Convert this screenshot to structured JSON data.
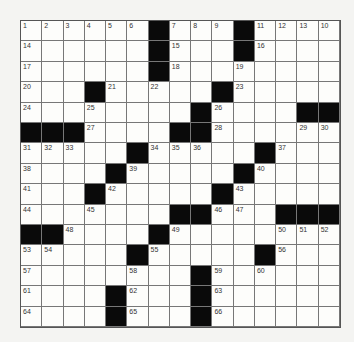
{
  "puzzle": {
    "rows": 15,
    "cols": 15,
    "blacks": [
      [
        0,
        6
      ],
      [
        0,
        10
      ],
      [
        1,
        6
      ],
      [
        1,
        10
      ],
      [
        2,
        6
      ],
      [
        3,
        3
      ],
      [
        3,
        9
      ],
      [
        4,
        8
      ],
      [
        4,
        13
      ],
      [
        4,
        14
      ],
      [
        5,
        0
      ],
      [
        5,
        1
      ],
      [
        5,
        2
      ],
      [
        5,
        7
      ],
      [
        5,
        8
      ],
      [
        6,
        5
      ],
      [
        6,
        11
      ],
      [
        7,
        4
      ],
      [
        7,
        10
      ],
      [
        8,
        3
      ],
      [
        8,
        9
      ],
      [
        9,
        7
      ],
      [
        9,
        8
      ],
      [
        9,
        12
      ],
      [
        9,
        13
      ],
      [
        9,
        14
      ],
      [
        10,
        0
      ],
      [
        10,
        1
      ],
      [
        10,
        6
      ],
      [
        11,
        5
      ],
      [
        11,
        11
      ],
      [
        12,
        8
      ],
      [
        13,
        4
      ],
      [
        13,
        8
      ],
      [
        14,
        4
      ],
      [
        14,
        8
      ]
    ],
    "numbers": {
      "0,0": "1",
      "0,1": "2",
      "0,2": "3",
      "0,3": "4",
      "0,4": "5",
      "0,5": "6",
      "0,7": "7",
      "0,8": "8",
      "0,9": "9",
      "0,11": "11",
      "0,12": "12",
      "0,13": "13",
      "0,14": "10",
      "1,0": "14",
      "1,7": "15",
      "1,11": "16",
      "2,0": "17",
      "2,7": "18",
      "2,10": "19",
      "3,0": "20",
      "3,4": "21",
      "3,6": "22",
      "3,10": "23",
      "4,0": "24",
      "4,3": "25",
      "4,9": "26",
      "5,3": "27",
      "5,9": "28",
      "5,13": "29",
      "5,14": "30",
      "6,0": "31",
      "6,1": "32",
      "6,2": "33",
      "6,6": "34",
      "6,7": "35",
      "6,8": "36",
      "6,12": "37",
      "7,0": "38",
      "7,5": "39",
      "7,11": "40",
      "8,0": "41",
      "8,4": "42",
      "8,10": "43",
      "9,0": "44",
      "9,3": "45",
      "9,9": "46",
      "9,10": "47",
      "10,2": "48",
      "10,7": "49",
      "10,12": "50",
      "10,13": "51",
      "10,14": "52",
      "11,0": "53",
      "11,1": "54",
      "11,6": "55",
      "11,12": "56",
      "12,0": "57",
      "12,5": "58",
      "12,9": "59",
      "12,11": "60",
      "13,0": "61",
      "13,5": "62",
      "13,9": "63",
      "14,0": "64",
      "14,5": "65",
      "14,9": "66"
    }
  }
}
